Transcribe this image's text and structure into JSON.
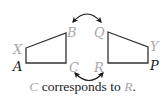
{
  "figure": {
    "left_shape": {
      "vertices": [
        {
          "name": "X",
          "x": 26,
          "y": 48,
          "color": "#a8a8a8",
          "label_x": 13,
          "label_y": 54
        },
        {
          "name": "B",
          "x": 66,
          "y": 33,
          "color": "#a8a8a8",
          "label_x": 67,
          "label_y": 36
        },
        {
          "name": "C",
          "x": 66,
          "y": 63,
          "color": "#a8a8a8",
          "label_x": 69,
          "label_y": 73
        },
        {
          "name": "A",
          "x": 26,
          "y": 63,
          "color": "#1a1a1a",
          "label_x": 13,
          "label_y": 71
        }
      ]
    },
    "right_shape": {
      "vertices": [
        {
          "name": "Q",
          "x": 108,
          "y": 32,
          "color": "#a8a8a8",
          "label_x": 94,
          "label_y": 37
        },
        {
          "name": "Y",
          "x": 148,
          "y": 47,
          "color": "#a8a8a8",
          "label_x": 150,
          "label_y": 50
        },
        {
          "name": "P",
          "x": 148,
          "y": 63,
          "color": "#1a1a1a",
          "label_x": 150,
          "label_y": 70
        },
        {
          "name": "R",
          "x": 108,
          "y": 63,
          "color": "#a8a8a8",
          "label_x": 94,
          "label_y": 72
        }
      ]
    },
    "arrows": [
      {
        "name": "top-double-arrow",
        "from": "B",
        "to": "Q"
      },
      {
        "name": "bottom-double-arrow",
        "from": "C",
        "to": "R"
      }
    ],
    "caption": {
      "var1": "C",
      "middle": " corresponds to ",
      "var2": "R",
      "end": "."
    },
    "colors": {
      "line": "#333333",
      "highlight_label": "#a8a8a8",
      "main_label": "#1a1a1a"
    }
  }
}
